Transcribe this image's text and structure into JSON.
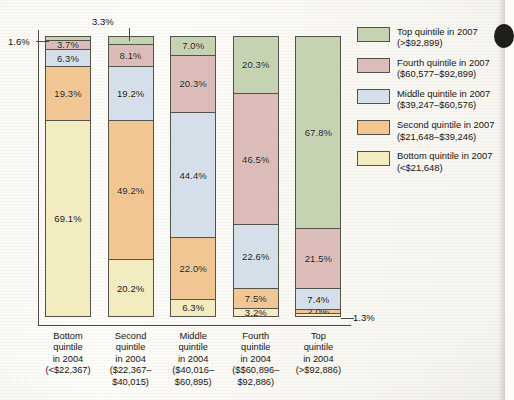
{
  "chart_data": {
    "type": "bar",
    "subtype": "stacked-100-percent",
    "title": "",
    "xlabel": "",
    "ylabel": "",
    "ylim": [
      0,
      100
    ],
    "grid": false,
    "legend_position": "right",
    "categories": [
      "Bottom quintile in 2004 (<$22,367)",
      "Second quintile in 2004 ($22,367–$40,015)",
      "Middle quintile in 2004 ($40,016–$60,895)",
      "Fourth quintile in 2004 ($$60,896–$92,886)",
      "Top quintile in 2004 (>$92,886)"
    ],
    "series": [
      {
        "name": "Bottom quintile in 2007 (<$21,648)",
        "color": "#f3ecc0",
        "values": [
          69.1,
          20.2,
          6.3,
          3.2,
          1.3
        ]
      },
      {
        "name": "Second quintile in 2007 ($21,648–$39,246)",
        "color": "#f2c692",
        "values": [
          19.3,
          49.2,
          22.0,
          7.5,
          2.0
        ]
      },
      {
        "name": "Middle quintile in 2007 ($39,247–$60,576)",
        "color": "#d5dfe9",
        "values": [
          6.3,
          19.2,
          44.4,
          22.6,
          7.4
        ]
      },
      {
        "name": "Fourth quintile in 2007 ($60,577–$92,899)",
        "color": "#dcbcb9",
        "values": [
          3.7,
          8.1,
          20.3,
          46.5,
          21.5
        ]
      },
      {
        "name": "Top quintile in 2007 (>$92,899)",
        "color": "#c5d3b2",
        "values": [
          1.6,
          3.3,
          7.0,
          20.3,
          67.8
        ]
      }
    ],
    "annotations": [
      {
        "text": "1.6%",
        "bar": 0,
        "series": 4,
        "placement": "left-callout"
      },
      {
        "text": "3.3%",
        "bar": 1,
        "series": 4,
        "placement": "top-callout"
      },
      {
        "text": "1.3%",
        "bar": 4,
        "series": 0,
        "placement": "right-callout"
      }
    ]
  },
  "bars": [
    {
      "x": 0,
      "xlabel_lines": [
        "Bottom",
        "quintile",
        "in 2004",
        "(<$22,367)"
      ],
      "segments": [
        {
          "label": "1.6%",
          "value": 1.6,
          "series": "top",
          "color": "#c5d3b2",
          "label_inside": false
        },
        {
          "label": "3.7%",
          "value": 3.7,
          "series": "fourth",
          "color": "#dcbcb9",
          "label_inside": true
        },
        {
          "label": "6.3%",
          "value": 6.3,
          "series": "middle",
          "color": "#d5dfe9",
          "label_inside": true
        },
        {
          "label": "19.3%",
          "value": 19.3,
          "series": "second",
          "color": "#f2c692",
          "label_inside": true
        },
        {
          "label": "69.1%",
          "value": 69.1,
          "series": "bottom",
          "color": "#f3ecc0",
          "label_inside": true
        }
      ]
    },
    {
      "x": 1,
      "xlabel_lines": [
        "Second",
        "quintile",
        "in 2004",
        "($22,367–",
        "$40,015)"
      ],
      "segments": [
        {
          "label": "3.3%",
          "value": 3.3,
          "series": "top",
          "color": "#c5d3b2",
          "label_inside": false
        },
        {
          "label": "8.1%",
          "value": 8.1,
          "series": "fourth",
          "color": "#dcbcb9",
          "label_inside": true
        },
        {
          "label": "19.2%",
          "value": 19.2,
          "series": "middle",
          "color": "#d5dfe9",
          "label_inside": true
        },
        {
          "label": "49.2%",
          "value": 49.2,
          "series": "second",
          "color": "#f2c692",
          "label_inside": true
        },
        {
          "label": "20.2%",
          "value": 20.2,
          "series": "bottom",
          "color": "#f3ecc0",
          "label_inside": true
        }
      ]
    },
    {
      "x": 2,
      "xlabel_lines": [
        "Middle",
        "quintile",
        "in 2004",
        "($40,016–",
        "$60,895)"
      ],
      "segments": [
        {
          "label": "7.0%",
          "value": 7.0,
          "series": "top",
          "color": "#c5d3b2",
          "label_inside": true
        },
        {
          "label": "20.3%",
          "value": 20.3,
          "series": "fourth",
          "color": "#dcbcb9",
          "label_inside": true
        },
        {
          "label": "44.4%",
          "value": 44.4,
          "series": "middle",
          "color": "#d5dfe9",
          "label_inside": true
        },
        {
          "label": "22.0%",
          "value": 22.0,
          "series": "second",
          "color": "#f2c692",
          "label_inside": true
        },
        {
          "label": "6.3%",
          "value": 6.3,
          "series": "bottom",
          "color": "#f3ecc0",
          "label_inside": true
        }
      ]
    },
    {
      "x": 3,
      "xlabel_lines": [
        "Fourth",
        "quintile",
        "in 2004",
        "($$60,896–",
        "$92,886)"
      ],
      "segments": [
        {
          "label": "20.3%",
          "value": 20.3,
          "series": "top",
          "color": "#c5d3b2",
          "label_inside": true
        },
        {
          "label": "46.5%",
          "value": 46.5,
          "series": "fourth",
          "color": "#dcbcb9",
          "label_inside": true
        },
        {
          "label": "22.6%",
          "value": 22.6,
          "series": "middle",
          "color": "#d5dfe9",
          "label_inside": true
        },
        {
          "label": "7.5%",
          "value": 7.5,
          "series": "second",
          "color": "#f2c692",
          "label_inside": true
        },
        {
          "label": "3.2%",
          "value": 3.2,
          "series": "bottom",
          "color": "#f3ecc0",
          "label_inside": true
        }
      ]
    },
    {
      "x": 4,
      "xlabel_lines": [
        "Top",
        "quintile",
        "in 2004",
        "(>$92,886)"
      ],
      "segments": [
        {
          "label": "67.8%",
          "value": 67.8,
          "series": "top",
          "color": "#c5d3b2",
          "label_inside": true
        },
        {
          "label": "21.5%",
          "value": 21.5,
          "series": "fourth",
          "color": "#dcbcb9",
          "label_inside": true
        },
        {
          "label": "7.4%",
          "value": 7.4,
          "series": "middle",
          "color": "#d5dfe9",
          "label_inside": true
        },
        {
          "label": "2.0%",
          "value": 2.0,
          "series": "second",
          "color": "#f2c692",
          "label_inside": true
        },
        {
          "label": "1.3%",
          "value": 1.3,
          "series": "bottom",
          "color": "#f3ecc0",
          "label_inside": false
        }
      ]
    }
  ],
  "callouts": {
    "left": "1.6%",
    "top": "3.3%",
    "right": "1.3%"
  },
  "legend": {
    "items": [
      {
        "color": "#c5d3b2",
        "line1": "Top quintile in 2007",
        "line2": "(>$92,899)"
      },
      {
        "color": "#dcbcb9",
        "line1": "Fourth quintile in 2007",
        "line2": "($60,577–$92,899)"
      },
      {
        "color": "#d5dfe9",
        "line1": "Middle quintile in 2007",
        "line2": "($39,247–$60,576)"
      },
      {
        "color": "#f2c692",
        "line1": "Second quintile in 2007",
        "line2": "($21,648–$39,246)"
      },
      {
        "color": "#f3ecc0",
        "line1": "Bottom quintile in 2007",
        "line2": "(<$21,648)"
      }
    ]
  }
}
